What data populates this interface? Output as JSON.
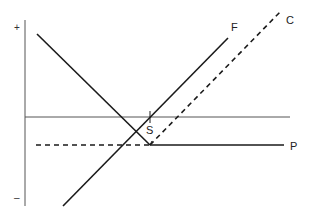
{
  "diagram": {
    "axis_labels": {
      "top": "+",
      "bottom": "–"
    },
    "lines": {
      "descending": {
        "label": ""
      },
      "F": {
        "label": "F",
        "style": "solid"
      },
      "C": {
        "label": "C",
        "style": "dashed"
      },
      "P": {
        "label": "P",
        "style": "solid"
      },
      "baseline": {
        "label": "",
        "style": "thin solid"
      },
      "P_dashed": {
        "label": "",
        "style": "dashed"
      }
    },
    "point_label": "S",
    "colors": {
      "line": "#1a1a1a",
      "axis": "#444444",
      "thin": "#555555"
    }
  }
}
